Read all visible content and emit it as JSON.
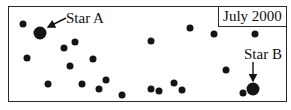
{
  "diagram": {
    "date_label": "July 2000",
    "labeled_stars": [
      {
        "name": "Star A",
        "x": 40,
        "y": 33,
        "size": 13
      },
      {
        "name": "Star B",
        "x": 253,
        "y": 89,
        "size": 13
      }
    ],
    "labels": {
      "star_a": "Star A",
      "star_b": "Star B"
    },
    "background_stars": [
      {
        "x": 23,
        "y": 24
      },
      {
        "x": 27,
        "y": 58
      },
      {
        "x": 64,
        "y": 48
      },
      {
        "x": 75,
        "y": 42
      },
      {
        "x": 70,
        "y": 66
      },
      {
        "x": 48,
        "y": 84
      },
      {
        "x": 82,
        "y": 84
      },
      {
        "x": 93,
        "y": 59
      },
      {
        "x": 99,
        "y": 89
      },
      {
        "x": 106,
        "y": 80
      },
      {
        "x": 122,
        "y": 95
      },
      {
        "x": 151,
        "y": 41
      },
      {
        "x": 151,
        "y": 89
      },
      {
        "x": 159,
        "y": 91
      },
      {
        "x": 174,
        "y": 83
      },
      {
        "x": 182,
        "y": 90
      },
      {
        "x": 190,
        "y": 28
      },
      {
        "x": 214,
        "y": 34
      },
      {
        "x": 226,
        "y": 70
      },
      {
        "x": 255,
        "y": 34
      },
      {
        "x": 243,
        "y": 93
      }
    ],
    "colors": {
      "ink": "#141414",
      "background": "#ffffff"
    }
  }
}
